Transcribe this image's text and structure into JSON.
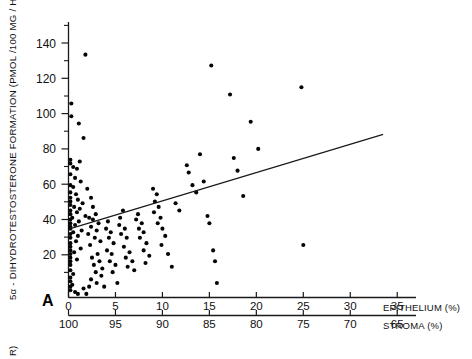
{
  "figure": {
    "panel_letter": "A",
    "background": "#ffffff",
    "ink_color": "#111111",
    "point_color": "#050505",
    "cut_off_label_below": "R)"
  },
  "axes": {
    "y": {
      "label": "5α - DIHYDROTESTOSTERONE FORMATION  (PMOL /100  MG / HR)",
      "ticks": [
        20,
        40,
        60,
        80,
        100,
        120,
        140
      ],
      "minor_ticks": [
        10,
        30,
        50,
        70,
        90,
        110,
        130,
        150
      ],
      "range": [
        0,
        152
      ]
    },
    "x_primary": {
      "label": "EPITHELIUM (%)",
      "ticks": [
        0,
        5,
        10,
        15,
        20,
        25,
        30,
        35
      ],
      "range": [
        0,
        37
      ]
    },
    "x_secondary": {
      "label": "STROMA (%)",
      "ticks": [
        100,
        95,
        90,
        85,
        80,
        75,
        70,
        65
      ],
      "range": [
        100,
        63
      ]
    }
  },
  "chart_data": {
    "type": "scatter",
    "title": "",
    "xlabel": "EPITHELIUM (%)",
    "ylabel": "5α - DIHYDROTESTOSTERONE FORMATION  (PMOL /100  MG / HR)",
    "xlabel_secondary": "STROMA (%)",
    "xlim": [
      0,
      37
    ],
    "ylim": [
      0,
      152
    ],
    "xticks": [
      0,
      5,
      10,
      15,
      20,
      25,
      30,
      35
    ],
    "xticks_secondary": [
      100,
      95,
      90,
      85,
      80,
      75,
      70,
      65
    ],
    "yticks": [
      20,
      40,
      60,
      80,
      100,
      120,
      140
    ],
    "grid": false,
    "legend": null,
    "marker": "filled-circle",
    "point_count": 143,
    "trendline": {
      "type": "linear-regression",
      "x_start": 0.2,
      "y_start": 38.0,
      "x_end": 33.5,
      "y_end": 90.0
    },
    "points": [
      [
        1.8,
        134
      ],
      [
        0.3,
        107
      ],
      [
        0.3,
        100
      ],
      [
        1.1,
        96
      ],
      [
        1.6,
        88
      ],
      [
        0.2,
        76
      ],
      [
        0.2,
        74
      ],
      [
        1.2,
        75
      ],
      [
        0.5,
        72
      ],
      [
        0.9,
        71
      ],
      [
        0.2,
        68
      ],
      [
        0.7,
        66
      ],
      [
        1.3,
        64
      ],
      [
        0.2,
        62
      ],
      [
        0.5,
        61
      ],
      [
        2.0,
        60
      ],
      [
        0.2,
        58
      ],
      [
        0.8,
        57
      ],
      [
        0.2,
        55
      ],
      [
        1.0,
        54
      ],
      [
        0.2,
        53
      ],
      [
        1.5,
        52
      ],
      [
        0.2,
        51
      ],
      [
        0.6,
        50
      ],
      [
        1.2,
        49
      ],
      [
        0.2,
        48
      ],
      [
        0.9,
        47
      ],
      [
        0.2,
        46
      ],
      [
        1.8,
        45
      ],
      [
        0.4,
        44
      ],
      [
        0.2,
        43
      ],
      [
        1.1,
        42
      ],
      [
        0.2,
        41
      ],
      [
        0.7,
        40
      ],
      [
        0.2,
        39
      ],
      [
        0.2,
        38
      ],
      [
        1.4,
        37
      ],
      [
        0.5,
        36
      ],
      [
        0.2,
        35
      ],
      [
        1.0,
        34
      ],
      [
        0.2,
        33
      ],
      [
        0.8,
        31
      ],
      [
        0.2,
        30
      ],
      [
        0.2,
        28
      ],
      [
        1.3,
        27
      ],
      [
        0.2,
        26
      ],
      [
        0.6,
        25
      ],
      [
        0.2,
        24
      ],
      [
        0.2,
        22
      ],
      [
        0.9,
        21
      ],
      [
        0.2,
        20
      ],
      [
        0.2,
        18
      ],
      [
        0.2,
        15
      ],
      [
        0.5,
        13
      ],
      [
        0.2,
        11
      ],
      [
        0.2,
        9
      ],
      [
        0.4,
        7
      ],
      [
        0.2,
        6
      ],
      [
        0.2,
        4
      ],
      [
        0.7,
        3
      ],
      [
        1.0,
        2
      ],
      [
        1.6,
        5
      ],
      [
        2.2,
        6
      ],
      [
        1.9,
        2
      ],
      [
        2.4,
        55
      ],
      [
        2.6,
        50
      ],
      [
        2.9,
        46
      ],
      [
        2.2,
        44
      ],
      [
        2.6,
        43
      ],
      [
        3.2,
        41
      ],
      [
        2.4,
        39
      ],
      [
        3.0,
        37
      ],
      [
        2.1,
        35
      ],
      [
        2.8,
        33
      ],
      [
        3.4,
        31
      ],
      [
        2.3,
        29
      ],
      [
        3.1,
        24
      ],
      [
        2.5,
        22
      ],
      [
        3.3,
        20
      ],
      [
        2.7,
        18
      ],
      [
        3.6,
        16
      ],
      [
        2.9,
        14
      ],
      [
        3.5,
        12
      ],
      [
        2.4,
        10
      ],
      [
        3.0,
        8
      ],
      [
        3.8,
        6
      ],
      [
        4.2,
        42
      ],
      [
        4.0,
        38
      ],
      [
        4.5,
        36
      ],
      [
        4.3,
        33
      ],
      [
        4.8,
        30
      ],
      [
        4.1,
        26
      ],
      [
        4.6,
        24
      ],
      [
        4.4,
        20
      ],
      [
        5.0,
        18
      ],
      [
        4.7,
        14
      ],
      [
        5.2,
        8
      ],
      [
        5.5,
        44
      ],
      [
        5.8,
        48
      ],
      [
        5.4,
        40
      ],
      [
        6.0,
        38
      ],
      [
        5.6,
        35
      ],
      [
        6.2,
        33
      ],
      [
        5.9,
        28
      ],
      [
        6.5,
        25
      ],
      [
        6.1,
        22
      ],
      [
        6.8,
        20
      ],
      [
        6.3,
        17
      ],
      [
        7.0,
        15
      ],
      [
        7.4,
        46
      ],
      [
        7.2,
        43
      ],
      [
        7.8,
        41
      ],
      [
        7.5,
        38
      ],
      [
        8.0,
        36
      ],
      [
        7.6,
        33
      ],
      [
        8.3,
        30
      ],
      [
        8.0,
        26
      ],
      [
        8.6,
        23
      ],
      [
        8.2,
        19
      ],
      [
        9.0,
        60
      ],
      [
        9.4,
        57
      ],
      [
        9.2,
        53
      ],
      [
        9.6,
        50
      ],
      [
        9.1,
        47
      ],
      [
        9.8,
        44
      ],
      [
        9.5,
        41
      ],
      [
        10.0,
        38
      ],
      [
        10.3,
        34
      ],
      [
        9.9,
        29
      ],
      [
        10.6,
        24
      ],
      [
        11.0,
        17
      ],
      [
        11.4,
        52
      ],
      [
        11.8,
        48
      ],
      [
        12.6,
        73
      ],
      [
        12.8,
        69
      ],
      [
        13.2,
        62
      ],
      [
        13.6,
        58
      ],
      [
        14.0,
        79
      ],
      [
        14.4,
        64
      ],
      [
        14.8,
        45
      ],
      [
        15.0,
        41
      ],
      [
        15.2,
        128
      ],
      [
        15.4,
        26
      ],
      [
        15.6,
        20
      ],
      [
        15.8,
        8
      ],
      [
        17.2,
        112
      ],
      [
        17.6,
        77
      ],
      [
        18.0,
        70
      ],
      [
        18.6,
        56
      ],
      [
        19.4,
        97
      ],
      [
        20.2,
        82
      ],
      [
        24.8,
        116
      ],
      [
        25.0,
        29
      ]
    ]
  }
}
